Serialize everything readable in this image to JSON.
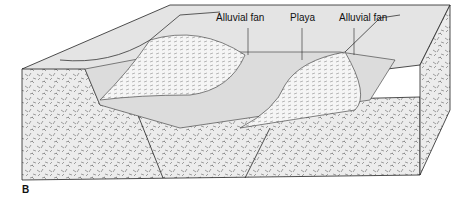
{
  "labels": {
    "left_fan": "Alluvial fan",
    "playa": "Playa",
    "right_fan": "Alluvial fan"
  },
  "panel_letter": "B",
  "colors": {
    "surface": "#e6e6e6",
    "bedrock": "#e9e9e9",
    "fan": "#f4f4f4",
    "line": "#222222"
  }
}
